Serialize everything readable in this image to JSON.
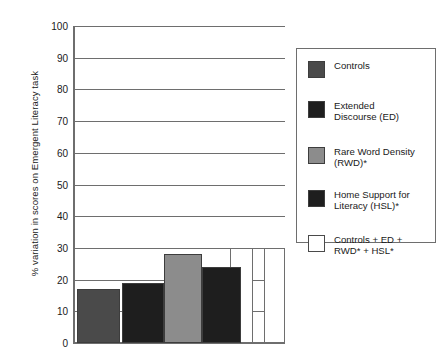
{
  "chart_data": {
    "type": "bar",
    "title": "",
    "xlabel": "",
    "ylabel": "% variation in scores on Emergent Literacy task",
    "ylim": [
      0,
      100
    ],
    "ytick_step": 10,
    "yticks": [
      "100",
      "90",
      "80",
      "70",
      "60",
      "50",
      "40",
      "30",
      "20",
      "10",
      "0"
    ],
    "grid": true,
    "legend_position": "right",
    "categories": [
      "Controls",
      "Extended Discourse (ED)",
      "Rare Word Density (RWD)*",
      "Home Support for Literacy (HSL)*",
      "Controls + ED + RWD* + HSL*",
      "Controls + ED + RWD* + HSL*"
    ],
    "values": [
      17,
      19,
      28,
      24,
      30,
      30
    ],
    "bar_colors": [
      "#4a4a4a",
      "#1e1e1e",
      "#8c8c8c",
      "#1e1e1e",
      "#ffffff",
      "#ffffff"
    ],
    "xtick_labels": [
      "",
      "",
      "",
      "",
      "",
      ""
    ]
  },
  "legend": {
    "items": [
      {
        "label": "Controls",
        "color": "#4a4a4a"
      },
      {
        "label": "Extended\nDiscourse (ED)",
        "color": "#1e1e1e"
      },
      {
        "label": "Rare Word Density\n(RWD)*",
        "color": "#8c8c8c"
      },
      {
        "label": "Home Support for\nLiteracy (HSL)*",
        "color": "#1e1e1e"
      },
      {
        "label": "Controls + ED +\nRWD* + HSL*",
        "color": "#ffffff"
      }
    ]
  },
  "style": {
    "axis_color": "#6e6e6e",
    "text_color": "#1a1a1a",
    "background": "#ffffff"
  }
}
